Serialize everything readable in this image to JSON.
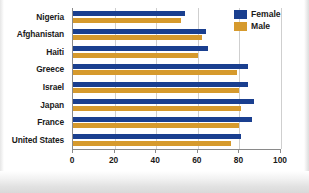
{
  "chart_data": {
    "type": "bar",
    "orientation": "horizontal",
    "title": "",
    "subtitle": "",
    "xlabel": "",
    "ylabel": "",
    "xlim": [
      0,
      100
    ],
    "xticks": [
      0,
      20,
      40,
      60,
      80,
      100
    ],
    "xtick_labels": [
      "0",
      "20",
      "40",
      "60",
      "80",
      "100"
    ],
    "grid": true,
    "grid_axis": "x",
    "legend_position": "top-right",
    "categories": [
      "Nigeria",
      "Afghanistan",
      "Haiti",
      "Greece",
      "Israel",
      "Japan",
      "France",
      "United States"
    ],
    "series": [
      {
        "name": "Female",
        "color": "#1a3f8f",
        "values": [
          54,
          64,
          65,
          84,
          84,
          87,
          86,
          81
        ]
      },
      {
        "name": "Male",
        "color": "#d69a2d",
        "values": [
          52,
          62,
          60,
          79,
          80,
          81,
          80,
          76
        ]
      }
    ]
  },
  "legend": {
    "items": [
      {
        "label": "Female",
        "swatch": "female"
      },
      {
        "label": "Male",
        "swatch": "male"
      }
    ]
  },
  "colors": {
    "female_blue": "#1a3f8f",
    "male_gold": "#d69a2d",
    "axis": "#8a8a8a",
    "gridline": "#cfcfcf",
    "text": "#1a1a1a",
    "background": "#ffffff"
  }
}
